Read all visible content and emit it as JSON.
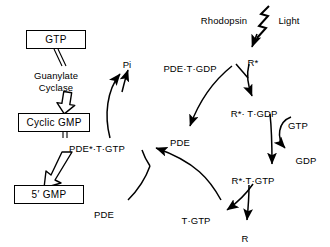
{
  "diagram": {
    "stroke_color": "#000000",
    "background_color": "#ffffff",
    "boxes": [
      {
        "id": "gtp",
        "label": "GTP",
        "x": 26,
        "y": 30,
        "w": 60,
        "h": 19
      },
      {
        "id": "cyclic_gmp",
        "label": "Cyclic GMP",
        "x": 18,
        "y": 113,
        "w": 72,
        "h": 19
      },
      {
        "id": "five_gmp",
        "label": "5′ GMP",
        "x": 14,
        "y": 185,
        "w": 70,
        "h": 19
      }
    ],
    "labels": [
      {
        "id": "guanylate_cyclase",
        "text": "Guanylate\nCyclase",
        "x": 56,
        "y": 70
      },
      {
        "id": "pde_t_gtp_star",
        "text": "PDE*·T·GTP",
        "x": 97,
        "y": 143
      },
      {
        "id": "pi",
        "text": "Pi",
        "x": 127,
        "y": 59
      },
      {
        "id": "pde_t_gdp",
        "text": "PDE·T·GDP",
        "x": 190,
        "y": 63
      },
      {
        "id": "pde_mid",
        "text": "PDE",
        "x": 180,
        "y": 137
      },
      {
        "id": "pde_bottom",
        "text": "PDE",
        "x": 104,
        "y": 209
      },
      {
        "id": "t_gtp",
        "text": "T·GTP",
        "x": 196,
        "y": 215
      },
      {
        "id": "rhodopsin",
        "text": "Rhodopsin",
        "x": 224,
        "y": 15
      },
      {
        "id": "light",
        "text": "Light",
        "x": 289,
        "y": 15
      },
      {
        "id": "r_star",
        "text": "R*",
        "x": 253,
        "y": 57
      },
      {
        "id": "r_star_t_gdp",
        "text": "R*· T·GDP",
        "x": 254,
        "y": 108
      },
      {
        "id": "r_star_t_gtp",
        "text": "R*·T·GTP",
        "x": 253,
        "y": 175
      },
      {
        "id": "gtp_right",
        "text": "GTP",
        "x": 298,
        "y": 120
      },
      {
        "id": "gdp_right",
        "text": "GDP",
        "x": 306,
        "y": 155
      },
      {
        "id": "r_bottom",
        "text": "R",
        "x": 245,
        "y": 233
      }
    ],
    "icons": {
      "lightning_bolt": "lightning-bolt-icon",
      "hollow_arrow": "hollow-arrow-icon"
    }
  }
}
